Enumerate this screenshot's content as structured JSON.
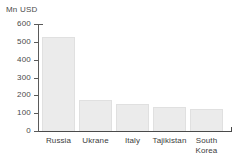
{
  "chart_data": {
    "type": "bar",
    "title": "",
    "subtitle": "",
    "xlabel": "",
    "ylabel": "Mn USD",
    "categories": [
      "Russia",
      "Ukrane",
      "Italy",
      "Tajikistan",
      "South Korea"
    ],
    "values": [
      528,
      174,
      151,
      135,
      122
    ],
    "series": [
      {
        "name": "Mn USD",
        "values": [
          528,
          174,
          151,
          135,
          122
        ]
      }
    ],
    "ylim": [
      0,
      600
    ],
    "y_ticks": [
      0,
      100,
      200,
      300,
      400,
      500,
      600
    ],
    "y_tick_labels": [
      "0",
      "100",
      "200",
      "300",
      "400",
      "500",
      "600"
    ],
    "grid": false,
    "legend": false,
    "legend_position": "none",
    "bar_color": "#ebebeb",
    "bar_border_color": "#e0e0e0",
    "axis_color": "#4a4a4a",
    "text_color": "#3c3c3c",
    "background_color": "#ffffff"
  },
  "axis": {
    "unit_label": "Mn USD"
  },
  "bars": [
    {
      "label": "Russia",
      "label_line1": "Russia",
      "label_line2": "",
      "value": 528
    },
    {
      "label": "Ukrane",
      "label_line1": "Ukrane",
      "label_line2": "",
      "value": 174
    },
    {
      "label": "Italy",
      "label_line1": "Italy",
      "label_line2": "",
      "value": 151
    },
    {
      "label": "Tajikistan",
      "label_line1": "Tajikistan",
      "label_line2": "",
      "value": 135
    },
    {
      "label": "South Korea",
      "label_line1": "South",
      "label_line2": "Korea",
      "value": 122
    }
  ],
  "y_axis_ticks": [
    {
      "label": "600",
      "value": 600
    },
    {
      "label": "500",
      "value": 500
    },
    {
      "label": "400",
      "value": 400
    },
    {
      "label": "300",
      "value": 300
    },
    {
      "label": "200",
      "value": 200
    },
    {
      "label": "100",
      "value": 100
    },
    {
      "label": "0",
      "value": 0
    }
  ]
}
